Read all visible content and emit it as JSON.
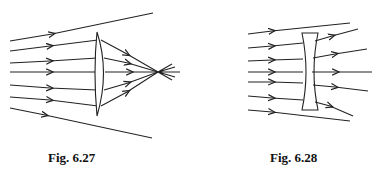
{
  "figures": [
    {
      "id": "fig-6-27",
      "caption": "Fig. 6.27",
      "lens": "convex (converging) lens",
      "description": "parallel rays converge to a focal point"
    },
    {
      "id": "fig-6-28",
      "caption": "Fig. 6.28",
      "lens": "concave (diverging) lens",
      "description": "parallel rays diverge after passing through lens"
    }
  ],
  "colors": {
    "line": "#222222",
    "background": "#ffffff"
  }
}
